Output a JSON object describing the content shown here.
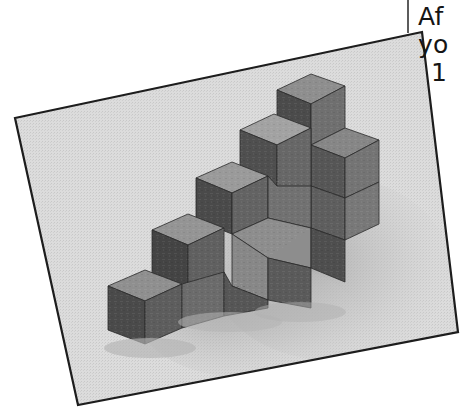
{
  "page": {
    "kind": "scanned-book-page",
    "background_color": "#ffffff",
    "width": 468,
    "height": 411
  },
  "column_rule": {
    "color": "#5c5c5c",
    "orientation": "vertical"
  },
  "text_column": {
    "clipped": true,
    "text_color": "#151515",
    "lines": [
      {
        "text": "Af"
      },
      {
        "text": "yo"
      },
      {
        "text": "1"
      }
    ]
  },
  "photograph": {
    "caption_visible": false,
    "subject": "stacked wooden cubes forming a staircase",
    "rotation_note": "photo tilted clockwise-left, printed as a halftone",
    "border_color": "#1d1d1d",
    "background_color": "#d6d6d6",
    "shadow_color": "#bdbdbd",
    "corners": {
      "top_left": [
        15,
        118
      ],
      "top_right": [
        422,
        32
      ],
      "bottom_right": [
        458,
        332
      ],
      "bottom_left": [
        78,
        405
      ]
    },
    "cube_palette": {
      "top_face_light": "#9a9a9a",
      "top_face_mid": "#8a8a8a",
      "top_face_dark": "#787878",
      "right_face_light": "#7a7a7a",
      "right_face_mid": "#6b6b6b",
      "right_face_dark": "#5a5a5a",
      "left_face_light": "#5c5c5c",
      "left_face_mid": "#4e4e4e",
      "left_face_dark": "#3f3f3f",
      "edge_line": "#2a2a2a"
    },
    "cube_count": 13,
    "staircase_steps": 4
  }
}
